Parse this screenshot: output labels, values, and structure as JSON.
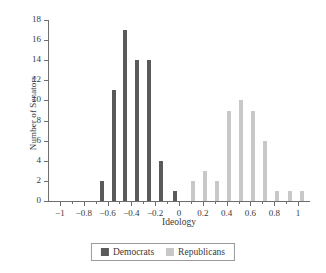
{
  "chart_data": {
    "type": "bar",
    "title": "",
    "xlabel": "Ideology",
    "ylabel": "Number of Senators",
    "xlim": [
      -1.1,
      1.1
    ],
    "ylim": [
      0,
      18
    ],
    "ytick_values": [
      0,
      2,
      4,
      6,
      8,
      10,
      12,
      14,
      16,
      18
    ],
    "ytick_labels": [
      "0",
      "2",
      "4",
      "6",
      "8",
      "10",
      "12",
      "14",
      "16",
      "18"
    ],
    "xtick_values": [
      -1,
      -0.8,
      -0.6,
      -0.4,
      -0.2,
      0,
      0.2,
      0.4,
      0.6,
      0.8,
      1
    ],
    "xtick_labels": [
      "−1",
      "−0.8",
      "−0.6",
      "−0.4",
      "−0.2",
      "0",
      "0.2",
      "0.4",
      "0.6",
      "0.8",
      "1"
    ],
    "xminor_values": [
      -0.9,
      -0.7,
      -0.5,
      -0.3,
      -0.1,
      0.1,
      0.3,
      0.5,
      0.7,
      0.9
    ],
    "grid": false,
    "legend_position": "bottom",
    "bin_width": 0.1,
    "series": [
      {
        "name": "Democrats",
        "color": "#5a5a5a",
        "points": [
          {
            "x": -0.65,
            "y": 2
          },
          {
            "x": -0.55,
            "y": 11
          },
          {
            "x": -0.45,
            "y": 17
          },
          {
            "x": -0.35,
            "y": 14
          },
          {
            "x": -0.25,
            "y": 14
          },
          {
            "x": -0.15,
            "y": 4
          },
          {
            "x": -0.03,
            "y": 1
          }
        ]
      },
      {
        "name": "Republicans",
        "color": "#c8c8c8",
        "points": [
          {
            "x": 0.12,
            "y": 2
          },
          {
            "x": 0.22,
            "y": 3
          },
          {
            "x": 0.32,
            "y": 2
          },
          {
            "x": 0.42,
            "y": 9
          },
          {
            "x": 0.52,
            "y": 10
          },
          {
            "x": 0.62,
            "y": 9
          },
          {
            "x": 0.72,
            "y": 6
          },
          {
            "x": 0.82,
            "y": 1
          },
          {
            "x": 0.93,
            "y": 1
          },
          {
            "x": 1.03,
            "y": 1
          }
        ]
      }
    ]
  },
  "legend": {
    "entries": [
      {
        "label": "Democrats",
        "color": "#5a5a5a"
      },
      {
        "label": "Republicans",
        "color": "#c8c8c8"
      }
    ]
  }
}
